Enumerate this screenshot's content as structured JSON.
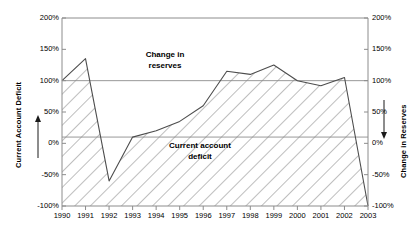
{
  "chart_data": {
    "type": "area",
    "title": "",
    "subtitle": "",
    "xlabel": "",
    "ylabel": "Current Account Deficit",
    "y2label": "Change in Reserves",
    "grid": false,
    "legend_position": "inside-annotations",
    "categories": [
      "1990",
      "1991",
      "1992",
      "1993",
      "1994",
      "1995",
      "1996",
      "1997",
      "1998",
      "1999",
      "2000",
      "2001",
      "2002",
      "2003"
    ],
    "x": [
      1990,
      1991,
      1992,
      1993,
      1994,
      1995,
      1996,
      1997,
      1998,
      1999,
      2000,
      2001,
      2002,
      2003
    ],
    "ylim": [
      -100,
      200
    ],
    "y2lim": [
      200,
      -100
    ],
    "ytick_labels": [
      "200%",
      "150%",
      "100%",
      "50%",
      "0%",
      "-50%",
      "-100%"
    ],
    "ytick_values": [
      200,
      150,
      100,
      50,
      0,
      -50,
      -100
    ],
    "y2tick_labels": [
      "-100%",
      "-50%",
      "0%",
      "50%",
      "100%",
      "150%",
      "200%"
    ],
    "y2tick_values": [
      -100,
      -50,
      0,
      50,
      100,
      150,
      200
    ],
    "series": [
      {
        "name": "Current account deficit",
        "fill": "hatched",
        "values": [
          100,
          135,
          -60,
          10,
          20,
          35,
          60,
          115,
          110,
          125,
          100,
          92,
          105,
          -100
        ]
      }
    ],
    "reference_lines": [
      {
        "name": "baseline-100",
        "value": 100
      },
      {
        "name": "baseline-10",
        "value": 10
      }
    ],
    "annotations": [
      {
        "name": "change-in-reserves",
        "line1": "Change in",
        "line2": "reserves"
      },
      {
        "name": "current-account-deficit",
        "line1": "Current account",
        "line2": "deficit"
      }
    ],
    "colors": {
      "axis": "#808080",
      "line": "#595959",
      "hatch": "#666666",
      "background": "#ffffff",
      "text": "#000000"
    }
  },
  "axes": {
    "left": {
      "title": "Current Account Deficit",
      "arrow": "up-arrow",
      "ticks": [
        "200%",
        "150%",
        "100%",
        "50%",
        "0%",
        "-50%",
        "-100%"
      ]
    },
    "right": {
      "title": "Change in Reserves",
      "arrow": "down-arrow",
      "ticks": [
        "-100%",
        "-50%",
        "0%",
        "50%",
        "100%",
        "150%",
        "200%"
      ]
    },
    "bottom": {
      "ticks": [
        "1990",
        "1991",
        "1992",
        "1993",
        "1994",
        "1995",
        "1996",
        "1997",
        "1998",
        "1999",
        "2000",
        "2001",
        "2002",
        "2003"
      ]
    }
  },
  "annotations": {
    "reserves": {
      "line1": "Change in",
      "line2": "reserves"
    },
    "deficit": {
      "line1": "Current account",
      "line2": "deficit"
    }
  }
}
